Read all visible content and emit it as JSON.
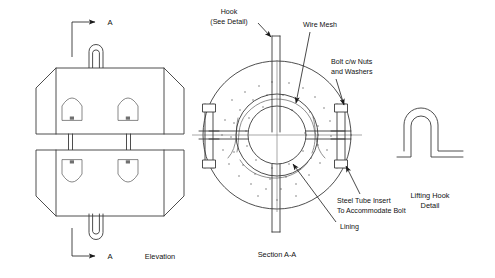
{
  "drawing": {
    "title": "Refractory Lined Vessel Section Drawing",
    "background_color": "#ffffff",
    "line_color": "#3a3a3a",
    "text_color": "#111111"
  },
  "views": {
    "elevation": {
      "caption": "Elevation",
      "section_mark_top": "A",
      "section_mark_bottom": "A",
      "hook_count": 2,
      "anchor_marker_count": 4
    },
    "section": {
      "caption": "Section A-A",
      "bolt_count": 2
    },
    "detail": {
      "caption_line1": "Lifting Hook",
      "caption_line2": "Detail"
    }
  },
  "annotations": [
    {
      "id": "hook",
      "line1": "Hook",
      "line2": "(See Detail)"
    },
    {
      "id": "wire-mesh",
      "line1": "Wire Mesh",
      "line2": ""
    },
    {
      "id": "bolt",
      "line1": "Bolt c/w Nuts",
      "line2": "and Washers"
    },
    {
      "id": "steel-tube",
      "line1": "Steel Tube Insert",
      "line2": "To Accommodate Bolt"
    },
    {
      "id": "lining",
      "line1": "Lining",
      "line2": ""
    }
  ]
}
